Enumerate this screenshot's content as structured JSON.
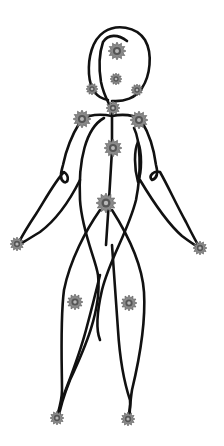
{
  "diagram": {
    "type": "body-point-figure",
    "colors": {
      "background": "#ffffff",
      "line": "#111111",
      "marker_fill": "#8a8a8a",
      "marker_dark": "#555555",
      "marker_center": "#b8b8b8"
    },
    "markers": [
      {
        "id": "head-top",
        "x": 117,
        "y": 51,
        "r": 9
      },
      {
        "id": "head-center",
        "x": 116,
        "y": 79,
        "r": 6
      },
      {
        "id": "head-left",
        "x": 92,
        "y": 89,
        "r": 6
      },
      {
        "id": "head-right",
        "x": 137,
        "y": 90,
        "r": 6
      },
      {
        "id": "neck",
        "x": 113,
        "y": 108,
        "r": 7
      },
      {
        "id": "shoulder-left",
        "x": 82,
        "y": 119,
        "r": 9
      },
      {
        "id": "shoulder-right",
        "x": 139,
        "y": 120,
        "r": 9
      },
      {
        "id": "chest",
        "x": 113,
        "y": 148,
        "r": 9
      },
      {
        "id": "pelvis",
        "x": 106,
        "y": 203,
        "r": 10
      },
      {
        "id": "hand-left",
        "x": 17,
        "y": 244,
        "r": 7
      },
      {
        "id": "hand-right",
        "x": 200,
        "y": 248,
        "r": 7
      },
      {
        "id": "knee-left",
        "x": 75,
        "y": 302,
        "r": 8
      },
      {
        "id": "knee-right",
        "x": 129,
        "y": 303,
        "r": 8
      },
      {
        "id": "foot-left",
        "x": 57,
        "y": 418,
        "r": 7
      },
      {
        "id": "foot-right",
        "x": 128,
        "y": 419,
        "r": 7
      }
    ]
  }
}
